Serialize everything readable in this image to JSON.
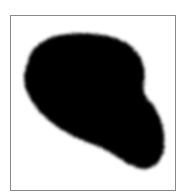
{
  "image": {
    "description": "Black irregular ink blob with fuzzy edges inside a thin gray rectangular frame",
    "colors": {
      "background": "#ffffff",
      "frame": "#8a8a8a",
      "blob": "#000000"
    }
  }
}
